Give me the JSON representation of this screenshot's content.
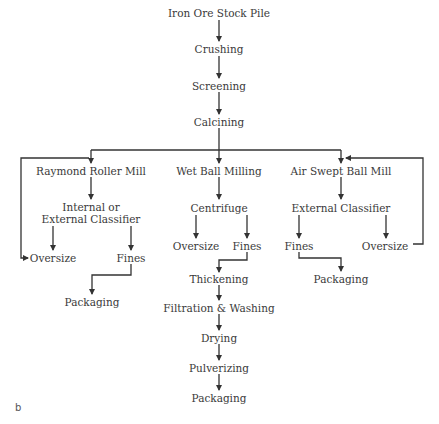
{
  "diagram": {
    "panel_label": "b",
    "line_color": "#333333",
    "text_color": "#3a3a3a",
    "main_chain": {
      "stock_pile": "Iron Ore Stock Pile",
      "crushing": "Crushing",
      "screening": "Screening",
      "calcining": "Calcining"
    },
    "branch_left": {
      "mill": "Raymond Roller Mill",
      "classifier_line1": "Internal or",
      "classifier_line2": "External Classifier",
      "oversize": "Oversize",
      "fines": "Fines",
      "packaging": "Packaging"
    },
    "branch_center": {
      "mill": "Wet Ball Milling",
      "centrifuge": "Centrifuge",
      "oversize": "Oversize",
      "fines": "Fines",
      "thickening": "Thickening",
      "filtration": "Filtration & Washing",
      "drying": "Drying",
      "pulverizing": "Pulverizing",
      "packaging": "Packaging"
    },
    "branch_right": {
      "mill": "Air Swept Ball Mill",
      "classifier": "External Classifier",
      "fines": "Fines",
      "oversize": "Oversize",
      "packaging": "Packaging"
    }
  }
}
